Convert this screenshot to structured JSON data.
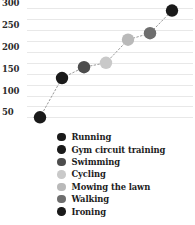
{
  "chart_data": {
    "type": "scatter",
    "title": "",
    "xlabel": "",
    "ylabel": "",
    "grid": true,
    "legend_position": "bottom",
    "ylim": [
      30,
      310
    ],
    "yticks": [
      50,
      100,
      150,
      200,
      250,
      300
    ],
    "ytick_labels": [
      "50",
      "100",
      "150",
      "200",
      "250",
      "300"
    ],
    "categories": [
      "Running",
      "Gym circuit training",
      "Swimming",
      "Cycling",
      "Mowing the lawn",
      "Walking",
      "Ironing"
    ],
    "values": [
      50,
      140,
      165,
      175,
      228,
      243,
      295
    ],
    "x": [
      1,
      2,
      3,
      4,
      5,
      6,
      7
    ],
    "point_colors": [
      "#1a1a1a",
      "#1a1a1a",
      "#4d4d4d",
      "#c9c9c9",
      "#b9b9b9",
      "#6e6e6e",
      "#1a1a1a"
    ],
    "connector": {
      "style": "dotted",
      "color": "#9a9a9a"
    }
  },
  "legend": {
    "items": [
      {
        "label": "Running",
        "color": "#1a1a1a"
      },
      {
        "label": "Gym circuit training",
        "color": "#1a1a1a"
      },
      {
        "label": "Swimming",
        "color": "#4d4d4d"
      },
      {
        "label": "Cycling",
        "color": "#c9c9c9"
      },
      {
        "label": "Mowing the lawn",
        "color": "#b9b9b9"
      },
      {
        "label": "Walking",
        "color": "#6e6e6e"
      },
      {
        "label": "Ironing",
        "color": "#1a1a1a"
      }
    ]
  },
  "axis": {
    "gridline_color": "#e8e8e8",
    "tick_text_color": "#2b2b2b"
  }
}
